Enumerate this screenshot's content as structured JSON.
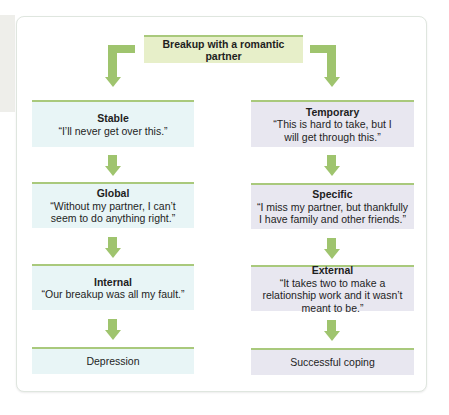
{
  "diagram": {
    "root": {
      "label": "Breakup with a romantic partner"
    },
    "left_column": [
      {
        "title": "Stable",
        "quote": "“I’ll never get over this.”"
      },
      {
        "title": "Global",
        "quote": "“Without my partner, I can’t seem to do anything right.”"
      },
      {
        "title": "Internal",
        "quote": "“Our breakup was all my fault.”"
      },
      {
        "title": "Depression",
        "quote": ""
      }
    ],
    "right_column": [
      {
        "title": "Temporary",
        "quote": "“This is hard to take, but I will get through this.”"
      },
      {
        "title": "Specific",
        "quote": "“I miss my partner, but thankfully I have family and other friends.”"
      },
      {
        "title": "External",
        "quote": "“It takes two to make a relationship work and it wasn’t meant to be.”"
      },
      {
        "title": "Successful coping",
        "quote": ""
      }
    ],
    "colors": {
      "arrow": "#9fc46e",
      "root_bg": "#e7efc9",
      "left_bg": "#e8f5f6",
      "right_bg": "#e8e7f0",
      "box_top_border": "#a9c97c"
    }
  }
}
